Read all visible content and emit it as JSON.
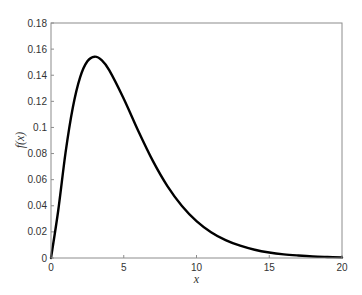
{
  "chart_data": {
    "type": "line",
    "title": "",
    "xlabel": "x",
    "ylabel": "f(x)",
    "xlim": [
      0,
      20
    ],
    "ylim": [
      0,
      0.18
    ],
    "grid": false,
    "legend": null,
    "x_ticks": [
      "0",
      "5",
      "10",
      "15",
      "20"
    ],
    "y_ticks": [
      "0",
      "0.02",
      "0.04",
      "0.06",
      "0.08",
      "0.1",
      "0.12",
      "0.14",
      "0.16",
      "0.18"
    ],
    "series": [
      {
        "name": "f(x)",
        "color": "#000000",
        "x": [
          0,
          0.5,
          1,
          1.5,
          2,
          2.5,
          3,
          3.5,
          4,
          5,
          6,
          7,
          8,
          9,
          10,
          11,
          12,
          13,
          14,
          15,
          16,
          17,
          18,
          19,
          20
        ],
        "values": [
          0,
          0.0366,
          0.0807,
          0.1153,
          0.1384,
          0.1507,
          0.1542,
          0.1514,
          0.1439,
          0.122,
          0.0973,
          0.0744,
          0.0551,
          0.0399,
          0.0283,
          0.0198,
          0.0137,
          0.0094,
          0.0063,
          0.0042,
          0.0028,
          0.0019,
          0.0012,
          0.0008,
          0.0005
        ]
      }
    ],
    "annotations": []
  },
  "axes": {
    "xlabel": "x",
    "ylabel": "f(x)"
  }
}
